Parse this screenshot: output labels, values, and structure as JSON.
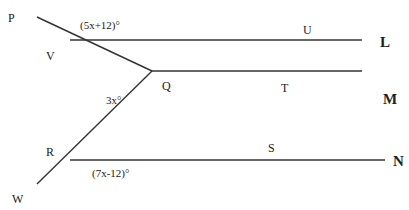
{
  "diagram": {
    "points": {
      "P": "P",
      "V": "V",
      "Q": "Q",
      "R": "R",
      "W": "W",
      "U": "U",
      "T": "T",
      "S": "S"
    },
    "lines": {
      "L": "L",
      "M": "M",
      "N": "N"
    },
    "angles": {
      "top": "(5x+12)°",
      "middle": "3x°",
      "bottom": "(7x-12)°"
    },
    "colors": {
      "stroke": "#333333",
      "text": "#222222"
    }
  }
}
